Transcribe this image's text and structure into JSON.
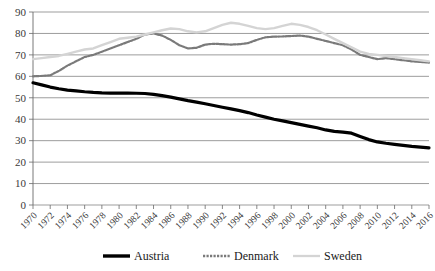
{
  "chart_data": {
    "type": "line",
    "title": "",
    "subtitle": "",
    "xlabel": "",
    "ylabel": "",
    "xlim": [
      1970,
      2016
    ],
    "ylim": [
      0,
      90
    ],
    "ytick_step": 10,
    "xtick_step": 2,
    "grid": "horizontal",
    "legend_position": "bottom",
    "y_ticks": [
      0,
      10,
      20,
      30,
      40,
      50,
      60,
      70,
      80,
      90
    ],
    "x_ticks": [
      1970,
      1972,
      1974,
      1976,
      1978,
      1980,
      1982,
      1984,
      1986,
      1988,
      1990,
      1992,
      1994,
      1996,
      1998,
      2000,
      2002,
      2004,
      2006,
      2008,
      2010,
      2012,
      2014,
      2016
    ],
    "x": [
      1970,
      1971,
      1972,
      1973,
      1974,
      1975,
      1976,
      1977,
      1978,
      1979,
      1980,
      1981,
      1982,
      1983,
      1984,
      1985,
      1986,
      1987,
      1988,
      1989,
      1990,
      1991,
      1992,
      1993,
      1994,
      1995,
      1996,
      1997,
      1998,
      1999,
      2000,
      2001,
      2002,
      2003,
      2004,
      2005,
      2006,
      2007,
      2008,
      2009,
      2010,
      2011,
      2012,
      2013,
      2014,
      2015,
      2016
    ],
    "series": [
      {
        "name": "Austria",
        "color": "#000000",
        "style": "solid",
        "width": 3.2,
        "values": [
          57.0,
          56.0,
          55.0,
          54.2,
          53.6,
          53.2,
          52.8,
          52.5,
          52.3,
          52.2,
          52.2,
          52.2,
          52.1,
          52.0,
          51.6,
          51.0,
          50.3,
          49.5,
          48.7,
          48.0,
          47.2,
          46.4,
          45.6,
          44.8,
          44.0,
          43.1,
          42.0,
          41.0,
          40.0,
          39.2,
          38.4,
          37.6,
          36.8,
          36.0,
          35.0,
          34.3,
          34.0,
          33.5,
          32.0,
          30.5,
          29.4,
          28.8,
          28.3,
          27.8,
          27.3,
          27.0,
          26.6
        ]
      },
      {
        "name": "Denmark",
        "color": "#7a7a7a",
        "style": "dotted",
        "width": 2.2,
        "values": [
          60.0,
          60.2,
          60.5,
          62.5,
          65.0,
          67.0,
          69.0,
          70.0,
          71.5,
          73.0,
          74.5,
          76.0,
          77.5,
          79.5,
          80.0,
          79.0,
          77.0,
          74.5,
          73.0,
          73.3,
          74.8,
          75.2,
          75.0,
          74.8,
          75.0,
          75.5,
          77.0,
          78.2,
          78.5,
          78.6,
          78.8,
          79.0,
          78.5,
          77.5,
          76.5,
          75.5,
          74.5,
          72.5,
          70.0,
          69.0,
          68.0,
          68.5,
          68.0,
          67.5,
          67.0,
          66.7,
          66.4
        ]
      },
      {
        "name": "Sweden",
        "color": "#d4d4d4",
        "style": "solid",
        "width": 2.4,
        "values": [
          68.0,
          68.5,
          69.0,
          69.5,
          70.5,
          71.5,
          72.5,
          73.0,
          74.5,
          76.0,
          77.5,
          78.0,
          78.5,
          79.5,
          80.5,
          81.5,
          82.3,
          82.0,
          81.0,
          80.5,
          81.0,
          82.5,
          84.0,
          85.0,
          84.5,
          83.5,
          82.5,
          82.0,
          82.5,
          83.5,
          84.5,
          84.0,
          83.0,
          81.5,
          79.5,
          77.5,
          75.5,
          73.5,
          71.5,
          70.5,
          70.0,
          69.5,
          69.0,
          68.5,
          68.0,
          67.5,
          67.0
        ]
      }
    ],
    "legend": [
      {
        "label": "Austria",
        "color": "#000000",
        "style": "solid"
      },
      {
        "label": "Denmark",
        "color": "#7a7a7a",
        "style": "dotted"
      },
      {
        "label": "Sweden",
        "color": "#d4d4d4",
        "style": "solid"
      }
    ]
  }
}
